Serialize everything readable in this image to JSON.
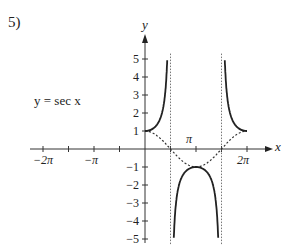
{
  "problem": {
    "number": "5)"
  },
  "chart_data": {
    "type": "line",
    "title": "",
    "function_label": "y = sec x",
    "xlabel": "x",
    "ylabel": "y",
    "xlim": [
      -6.8,
      7.0
    ],
    "ylim": [
      -5,
      5
    ],
    "x_ticks": [
      "−2π",
      "−π",
      "π",
      "2π"
    ],
    "y_ticks": [
      "5",
      "4",
      "3",
      "2",
      "1",
      "−1",
      "−2",
      "−3",
      "−4",
      "−5"
    ],
    "series": [
      {
        "name": "sec x",
        "style": "solid",
        "domain": [
          0,
          6.2832
        ],
        "asymptotes": [
          "π/2",
          "3π/2"
        ]
      },
      {
        "name": "cos x",
        "style": "dotted",
        "domain": [
          0,
          6.2832
        ]
      }
    ],
    "asymptotes_x": [
      "π/2",
      "3π/2"
    ],
    "grid": false,
    "legend": "none"
  }
}
